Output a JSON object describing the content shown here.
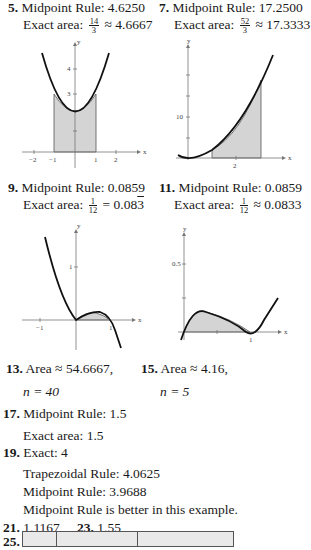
{
  "problems": {
    "p5": {
      "num": "5.",
      "line1_label": "Midpoint Rule:",
      "line1_value": "4.6250",
      "line2_label": "Exact area:",
      "frac_num": "14",
      "frac_den": "3",
      "approx": "≈ 4.6667"
    },
    "p7": {
      "num": "7.",
      "line1_label": "Midpoint Rule:",
      "line1_value": "17.2500",
      "line2_label": "Exact area:",
      "frac_num": "52",
      "frac_den": "3",
      "approx": "≈ 17.3333"
    },
    "p9": {
      "num": "9.",
      "line1_label": "Midpoint Rule:",
      "line1_value": "0.0859",
      "line2_label": "Exact area:",
      "frac_num": "1",
      "frac_den": "12",
      "approx_eq": "=",
      "approx_val": "0.08",
      "approx_rep": "3"
    },
    "p11": {
      "num": "11.",
      "line1_label": "Midpoint Rule:",
      "line1_value": "0.0859",
      "line2_label": "Exact area:",
      "frac_num": "1",
      "frac_den": "12",
      "approx": "≈ 0.0833"
    },
    "p13": {
      "num": "13.",
      "line1": "Area ≈ 54.6667,",
      "line2": "n = 40"
    },
    "p15": {
      "num": "15.",
      "line1": "Area ≈ 4.16,",
      "line2": "n = 5"
    },
    "p17": {
      "num": "17.",
      "line1": "Midpoint Rule:  1.5",
      "line2": "Exact area:  1.5"
    },
    "p19": {
      "num": "19.",
      "line1": "Exact:  4",
      "line2": "Trapezoidal Rule:  4.0625",
      "line3": "Midpoint Rule:  3.9688",
      "line4": "Midpoint Rule is better in this example."
    },
    "p21": {
      "num": "21.",
      "value": "1.1167"
    },
    "p23": {
      "num": "23.",
      "value": "1.55"
    },
    "p25": {
      "num": "25."
    }
  },
  "graphs": {
    "g5": {
      "y_axis": "y",
      "x_axis": "x",
      "x_ticks": [
        "−2",
        "−1",
        "1",
        "2"
      ],
      "y_ticks": [
        "3",
        "4"
      ]
    },
    "g7": {
      "y_axis": "y",
      "x_axis": "x",
      "x_ticks": [
        "2"
      ],
      "y_ticks": [
        "10"
      ]
    },
    "g9": {
      "y_axis": "y",
      "x_axis": "x",
      "x_ticks": [
        "−1",
        "1"
      ],
      "y_ticks": [
        "1"
      ]
    },
    "g11": {
      "y_axis": "y",
      "x_axis": "x",
      "x_ticks": [
        "1"
      ],
      "y_ticks": [
        "0.5"
      ]
    }
  }
}
